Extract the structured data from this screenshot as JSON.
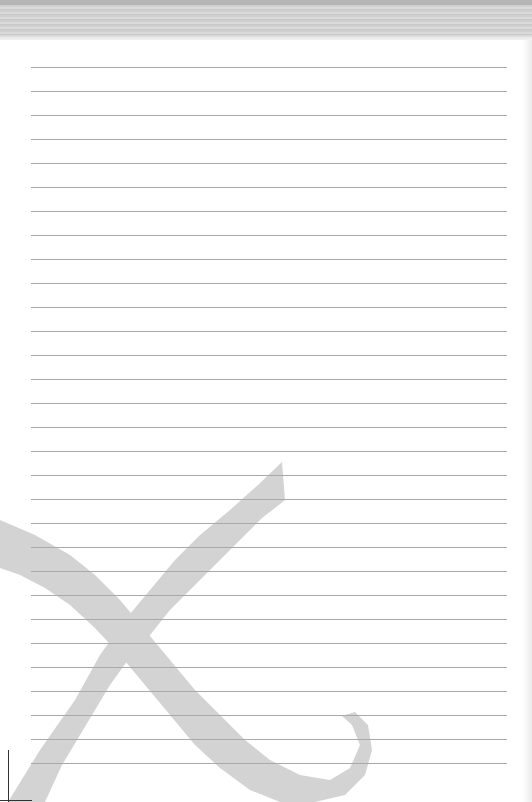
{
  "page": {
    "type": "lined-notepaper",
    "background_color": "#ffffff",
    "rule_color": "#a9a9a9",
    "watermark_color": "#d3d3d3",
    "line_count": 30,
    "first_line_y": 67,
    "line_spacing": 24,
    "line_left": 31,
    "line_width": 476
  },
  "header": {
    "texture": "gray-striped-band",
    "height": 40
  },
  "watermark": {
    "glyph": "X",
    "style": "brush-stroke"
  },
  "crop_mark": {
    "position": "bottom-left"
  }
}
